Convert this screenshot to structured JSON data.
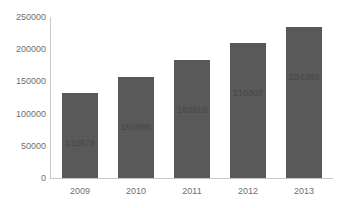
{
  "chart_data": {
    "type": "bar",
    "title": "",
    "xlabel": "",
    "ylabel": "",
    "categories": [
      "2009",
      "2010",
      "2011",
      "2012",
      "2013"
    ],
    "values": [
      132678,
      156998,
      183919,
      210307,
      234380
    ],
    "data_labels": [
      "132678",
      "156998",
      "183919",
      "210307",
      "234380"
    ],
    "ylim": [
      0,
      250000
    ],
    "ytick_values": [
      0,
      50000,
      100000,
      150000,
      200000,
      250000
    ],
    "ytick_labels": [
      "0",
      "50000",
      "100000",
      "150000",
      "200000",
      "250000"
    ],
    "grid": false,
    "legend": false,
    "legend_position": "none",
    "bar_color": "#595959",
    "data_label_color": "#474747",
    "axis_color": "#c9c9c9",
    "tick_label_color": "#6f6f6f",
    "background_color": "#ffffff",
    "title_remnant": ""
  }
}
